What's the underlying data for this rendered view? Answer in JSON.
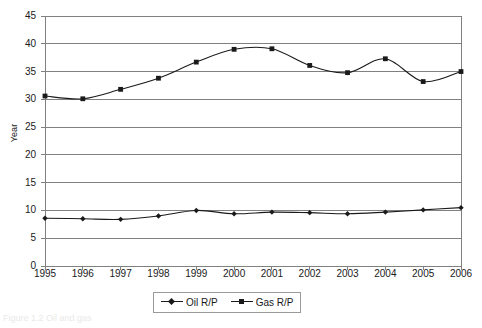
{
  "chart_data": {
    "type": "line",
    "title": "",
    "xlabel": "",
    "ylabel": "Year",
    "x": [
      1995,
      1996,
      1997,
      1998,
      1999,
      2000,
      2001,
      2002,
      2003,
      2004,
      2005,
      2006
    ],
    "categories": [
      "1995",
      "1996",
      "1997",
      "1998",
      "1999",
      "2000",
      "2001",
      "2002",
      "2003",
      "2004",
      "2005",
      "2006"
    ],
    "series": [
      {
        "name": "Oil R/P",
        "marker": "diamond",
        "color": "#1a1a1a",
        "values": [
          8.6,
          8.5,
          8.4,
          9.0,
          10.0,
          9.4,
          9.7,
          9.6,
          9.4,
          9.7,
          10.1,
          10.5
        ]
      },
      {
        "name": "Gas R/P",
        "marker": "square",
        "color": "#1a1a1a",
        "values": [
          30.6,
          30.1,
          31.8,
          33.8,
          36.7,
          39.0,
          39.1,
          36.1,
          34.8,
          37.3,
          33.2,
          35.0
        ]
      }
    ],
    "ylim": [
      0,
      45
    ],
    "ytick_step": 5,
    "yticks": [
      "45",
      "40",
      "35",
      "30",
      "25",
      "20",
      "15",
      "10",
      "5",
      "0"
    ],
    "grid": "horizontal",
    "legend_position": "bottom-center",
    "plot_background": "#ffffff",
    "gridline_color": "#808080",
    "axis_color": "#808080"
  },
  "legend": {
    "entries": [
      {
        "label": "Oil R/P",
        "marker_icon": "diamond-marker-icon"
      },
      {
        "label": "Gas R/P",
        "marker_icon": "square-marker-icon"
      }
    ]
  },
  "caption": {
    "remnant_text": "Figure 1.2 Oil and gas"
  }
}
